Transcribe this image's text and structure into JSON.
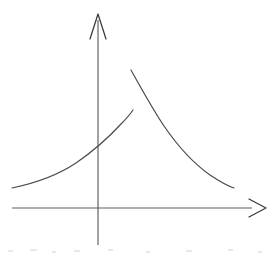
{
  "figure": {
    "background_color": "#ffffff",
    "axis_color": "#5d5d5d",
    "arrow_color": "#3a3a3a",
    "curve_color": "#4a4a4a",
    "width": 279,
    "height": 257
  },
  "axes": {
    "x_axis": {
      "label": "",
      "name": "horizontal-axis",
      "start_x": 12,
      "end_x": 252,
      "y": 208,
      "arrow_tip_x": 266,
      "arrow_tip_y": 208,
      "arrow_barb_back_x": 249,
      "arrow_barb_top_y": 199,
      "arrow_barb_bottom_y": 217,
      "arrow_style": "open-v"
    },
    "y_axis": {
      "label": "",
      "name": "vertical-axis",
      "x": 98,
      "start_y": 245,
      "end_y": 20,
      "arrow_tip_x": 98,
      "arrow_tip_y": 14,
      "arrow_barb_left_x": 90,
      "arrow_barb_right_x": 106,
      "arrow_barb_y": 39,
      "arrow_style": "open-v"
    },
    "origin": {
      "x": 98,
      "y": 208
    }
  },
  "curve": {
    "description": "Two separate branches meeting at a vertical jump near x = 132",
    "branches": [
      {
        "name": "left-branch",
        "shape": "rising-convex",
        "start": {
          "x": 12,
          "y": 188
        },
        "end": {
          "x": 133,
          "y": 110
        },
        "y_axis_crossing": {
          "x": 98,
          "y": 150
        },
        "path": "M 12 188 C 36 183 58 175 76 163 C 92 152 110 136 121 124 C 127 118 131 113 133 110"
      },
      {
        "name": "right-branch",
        "shape": "falling-convex-decay",
        "start": {
          "x": 131,
          "y": 70
        },
        "end": {
          "x": 234,
          "y": 188
        },
        "path": "M 131 70 C 141 88 152 108 164 126 C 177 145 193 163 210 175 C 219 181 228 186 234 188"
      }
    ],
    "discontinuity": {
      "at_x": 132,
      "lower_y": 110,
      "upper_y": 70,
      "type": "jump"
    }
  },
  "artifacts": {
    "scan_noise_caption": "",
    "noise_marks": [
      {
        "x": 8,
        "y": 250,
        "w": 5,
        "h": 2
      },
      {
        "x": 30,
        "y": 249,
        "w": 7,
        "h": 2
      },
      {
        "x": 52,
        "y": 251,
        "w": 4,
        "h": 2
      },
      {
        "x": 74,
        "y": 250,
        "w": 6,
        "h": 2
      },
      {
        "x": 108,
        "y": 249,
        "w": 5,
        "h": 2
      },
      {
        "x": 146,
        "y": 251,
        "w": 4,
        "h": 2
      },
      {
        "x": 186,
        "y": 250,
        "w": 6,
        "h": 2
      },
      {
        "x": 228,
        "y": 249,
        "w": 5,
        "h": 2
      },
      {
        "x": 258,
        "y": 251,
        "w": 4,
        "h": 2
      }
    ]
  }
}
